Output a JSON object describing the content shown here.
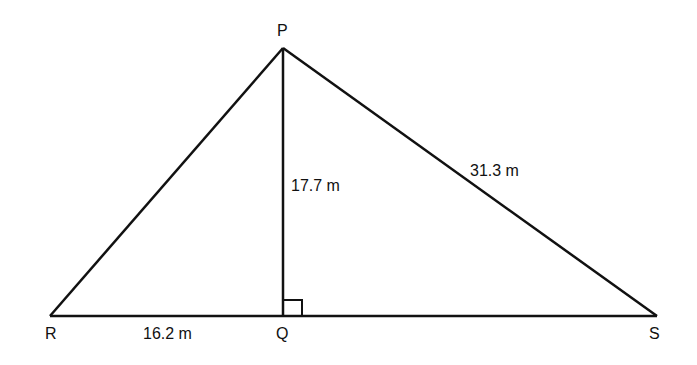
{
  "diagram": {
    "type": "triangle-with-altitude",
    "vertices": {
      "P": {
        "label": "P",
        "x": 283,
        "y": 48
      },
      "R": {
        "label": "R",
        "x": 50,
        "y": 316
      },
      "Q": {
        "label": "Q",
        "x": 283,
        "y": 316
      },
      "S": {
        "label": "S",
        "x": 657,
        "y": 316
      }
    },
    "measurements": {
      "PQ": "17.7 m",
      "PS": "31.3 m",
      "RQ": "16.2 m"
    },
    "right_angle_at": "Q",
    "line_color": "#111111"
  }
}
